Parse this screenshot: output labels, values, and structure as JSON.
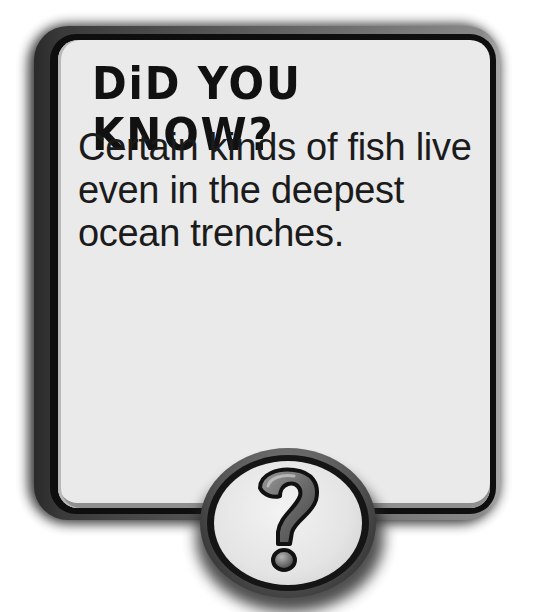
{
  "card": {
    "title": "DiD YOU KNOW?",
    "body_lines": [
      "Certain kinds of fish live",
      "even in the deepest",
      "ocean trenches."
    ],
    "badge_icon": "question-mark-icon"
  },
  "colors": {
    "panel": "#eaeaea",
    "frame": "#0e0e0e",
    "text": "#1b1b1b",
    "badge_glyph": "#6a6a6a"
  }
}
